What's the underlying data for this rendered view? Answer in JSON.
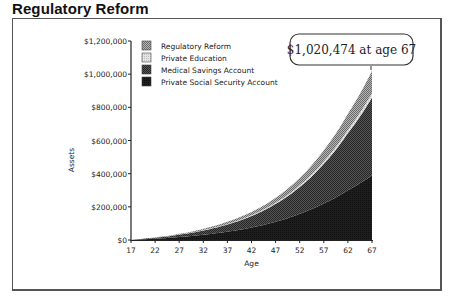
{
  "page": {
    "title": "Regulatory Reform"
  },
  "callout": {
    "text": "$1,020,474 at age 67"
  },
  "chart_data": {
    "type": "area",
    "stacked": true,
    "title": "Regulatory Reform",
    "xlabel": "Age",
    "ylabel": "Assets",
    "x": [
      17,
      22,
      27,
      32,
      37,
      42,
      47,
      52,
      57,
      62,
      67
    ],
    "x_tick_labels": [
      "17",
      "22",
      "27",
      "32",
      "37",
      "42",
      "47",
      "52",
      "57",
      "62",
      "67"
    ],
    "y_tick_labels": [
      "$0",
      "$200,000",
      "$400,000",
      "$600,000",
      "$800,000",
      "$1,000,000",
      "$1,200,000"
    ],
    "ylim": [
      0,
      1200000
    ],
    "grid": false,
    "legend_position": "upper-left-inside",
    "series": [
      {
        "name": "Private Social Security Account",
        "color": "#1a1a1a",
        "values": [
          0,
          8000,
          18000,
          32000,
          50000,
          75000,
          110000,
          158000,
          220000,
          300000,
          390000
        ]
      },
      {
        "name": "Medical Savings Account",
        "color": "#3c3c3c",
        "values": [
          0,
          6000,
          14000,
          26000,
          44000,
          70000,
          108000,
          162000,
          240000,
          345000,
          470000
        ]
      },
      {
        "name": "Private Education",
        "color": "#cfcfcf",
        "values": [
          0,
          500,
          1000,
          2000,
          3000,
          4500,
          6500,
          9500,
          13500,
          19000,
          25474
        ]
      },
      {
        "name": "Regulatory Reform",
        "color": "#8a8a8a",
        "values": [
          0,
          1500,
          4000,
          8000,
          13000,
          20000,
          30000,
          45000,
          68000,
          98000,
          135000
        ]
      }
    ],
    "legend": [
      "Regulatory Reform",
      "Private Education",
      "Medical Savings Account",
      "Private Social Security Account"
    ],
    "annotations": [
      {
        "text": "$1,020,474 at age 67",
        "x": 67,
        "y": 1020474
      }
    ]
  }
}
